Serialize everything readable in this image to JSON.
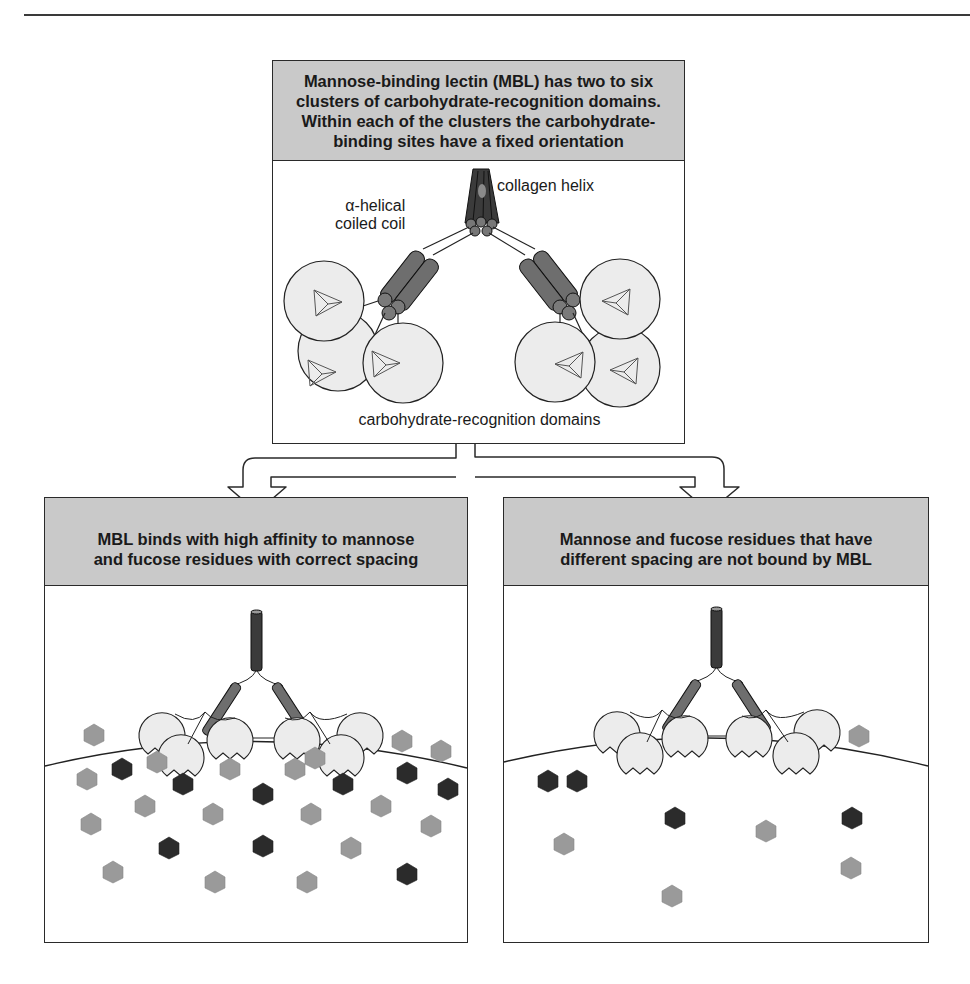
{
  "figure": {
    "top_panel": {
      "header": "Mannose-binding lectin (MBL) has two to six\nclusters of carbohydrate-recognition domains.\nWithin each of the clusters the carbohydrate-\nbinding sites have a fixed orientation",
      "labels": {
        "collagen_helix": "collagen helix",
        "coiled_coil": "α-helical\ncoiled coil",
        "crd": "carbohydrate-recognition domains"
      }
    },
    "left_panel": {
      "header": "MBL binds with high affinity to mannose\nand fucose residues with correct spacing"
    },
    "right_panel": {
      "header": "Mannose and fucose residues that have\ndifferent spacing are not bound by MBL"
    },
    "colors": {
      "header_fill": "#c9c9c9",
      "collagen_dark": "#3b3b3b",
      "coil_mid": "#6e6e6e",
      "domain_fill": "#ededed",
      "sugar_light": "#9a9a9a",
      "sugar_dark": "#2b2b2b",
      "line": "#222222"
    }
  }
}
